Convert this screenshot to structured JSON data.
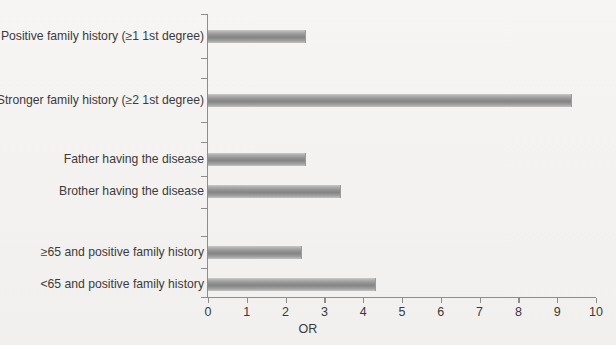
{
  "chart_data": {
    "type": "bar",
    "orientation": "horizontal",
    "title": "",
    "xlabel": "OR",
    "ylabel": "",
    "xlim": [
      0,
      10
    ],
    "xticks": [
      0,
      1,
      2,
      3,
      4,
      5,
      6,
      7,
      8,
      9,
      10
    ],
    "xtick_labels": [
      "0",
      "1",
      "2",
      "3",
      "4",
      "5",
      "6",
      "7",
      "8",
      "9",
      "10"
    ],
    "grid": false,
    "legend": false,
    "bar_color": "#8f8f8f",
    "categories": [
      "Positive family history (≥1 1st degree)",
      "Stronger family history (≥2 1st degree)",
      "Father having the disease",
      "Brother having the disease",
      "≥65 and positive family history",
      "<65 and positive family history"
    ],
    "values": [
      2.5,
      9.35,
      2.5,
      3.4,
      2.4,
      4.3
    ]
  },
  "axis": {
    "x_title": "OR"
  }
}
